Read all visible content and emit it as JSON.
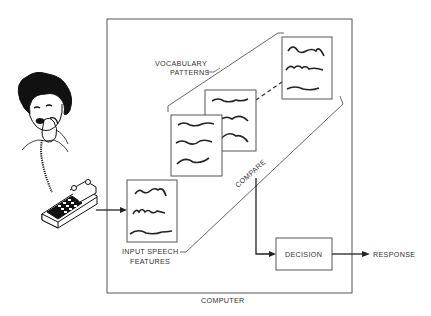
{
  "diagram": {
    "labels": {
      "vocabulary_line1": "VOCABULARY",
      "vocabulary_line2": "PATTERNS",
      "compare": "COMPARE",
      "input_line1": "INPUT SPEECH",
      "input_line2": "FEATURES",
      "decision": "DECISION",
      "response": "RESPONSE",
      "computer": "COMPUTER"
    },
    "nodes": [
      {
        "id": "caller",
        "label": "Woman on telephone"
      },
      {
        "id": "telephone",
        "label": "Telephone"
      },
      {
        "id": "input",
        "label": "INPUT SPEECH FEATURES"
      },
      {
        "id": "vocab",
        "label": "VOCABULARY PATTERNS"
      },
      {
        "id": "compare",
        "label": "COMPARE"
      },
      {
        "id": "decision",
        "label": "DECISION"
      },
      {
        "id": "response",
        "label": "RESPONSE"
      },
      {
        "id": "computer",
        "label": "COMPUTER"
      }
    ],
    "edges": [
      {
        "from": "telephone",
        "to": "input"
      },
      {
        "from": "compare",
        "to": "decision"
      },
      {
        "from": "decision",
        "to": "response"
      }
    ],
    "colors": {
      "line": "#555555",
      "text": "#333333",
      "ink": "#222222"
    }
  }
}
